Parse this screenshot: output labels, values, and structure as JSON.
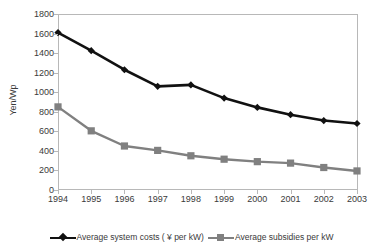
{
  "chart_data": {
    "type": "line",
    "title": "",
    "xlabel": "",
    "ylabel": "Yen/Wp",
    "categories": [
      "1994",
      "1995",
      "1996",
      "1997",
      "1998",
      "1999",
      "2000",
      "2001",
      "2002",
      "2003"
    ],
    "ylim": [
      0,
      1800
    ],
    "yticks": [
      0,
      200,
      400,
      600,
      800,
      1000,
      1200,
      1400,
      1600,
      1800
    ],
    "grid": false,
    "legend_position": "bottom",
    "series": [
      {
        "name": "Average system costs ( ¥ per kW)",
        "color": "#111111",
        "marker": "diamond",
        "values": [
          1610,
          1425,
          1230,
          1060,
          1075,
          940,
          845,
          770,
          710,
          680
        ]
      },
      {
        "name": "Average subsidies per kW",
        "color": "#808080",
        "marker": "square",
        "values": [
          850,
          605,
          450,
          405,
          350,
          315,
          290,
          275,
          230,
          195
        ]
      }
    ]
  },
  "axes": {
    "y_title": "Yen/Wp"
  },
  "legend": {
    "items": [
      {
        "label": "Average system costs ( ¥ per kW)",
        "marker": "diamond-marker-icon",
        "color": "#111111"
      },
      {
        "label": "Average subsidies per kW",
        "marker": "square-marker-icon",
        "color": "#808080"
      }
    ]
  },
  "colors": {
    "costs": "#111111",
    "subsidies": "#808080",
    "axis": "#b8b8b8",
    "text": "#3a3a3a",
    "background": "#ffffff"
  }
}
